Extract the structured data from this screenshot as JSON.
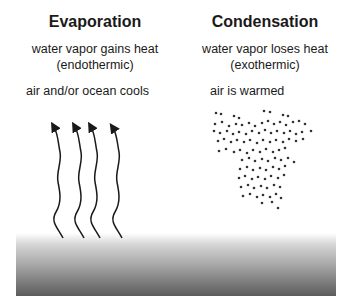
{
  "evaporation": {
    "title": "Evaporation",
    "line1": "water vapor gains heat",
    "line2": "(endothermic)",
    "line3": "air and/or ocean cools",
    "arrow_count": 4
  },
  "condensation": {
    "title": "Condensation",
    "line1": "water vapor loses heat",
    "line2": "(exothermic)",
    "line3": "air is warmed",
    "droplet_icon": "water-droplet-cluster"
  },
  "ocean": {
    "label": "",
    "gradient_top": "#ffffff",
    "gradient_bottom": "#5c5c5c"
  },
  "colors": {
    "text": "#1a1a1a",
    "arrows": "#1a1a1a",
    "droplets": "#333333"
  }
}
